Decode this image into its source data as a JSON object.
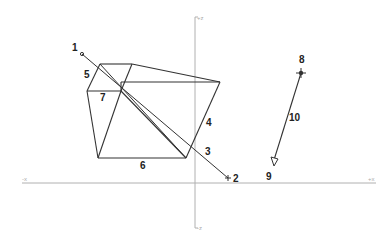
{
  "canvas": {
    "width": 391,
    "height": 244,
    "background": "#ffffff"
  },
  "axes": {
    "color": "#b0b0b0",
    "vertical": {
      "x": 195,
      "y1": 17,
      "y2": 228,
      "top_label": "+z",
      "bottom_label": "-z"
    },
    "horizontal": {
      "y": 183,
      "x1": 22,
      "x2": 376,
      "left_label": "-x",
      "right_label": "+x"
    }
  },
  "labels": [
    {
      "id": "1",
      "text": "1",
      "x": 72,
      "y": 51
    },
    {
      "id": "2",
      "text": "2",
      "x": 233,
      "y": 182
    },
    {
      "id": "3",
      "text": "3",
      "x": 205,
      "y": 155
    },
    {
      "id": "4",
      "text": "4",
      "x": 206,
      "y": 126
    },
    {
      "id": "5",
      "text": "5",
      "x": 84,
      "y": 78
    },
    {
      "id": "6",
      "text": "6",
      "x": 140,
      "y": 169
    },
    {
      "id": "7",
      "text": "7",
      "x": 100,
      "y": 101
    },
    {
      "id": "8",
      "text": "8",
      "x": 299,
      "y": 63
    },
    {
      "id": "9",
      "text": "9",
      "x": 266,
      "y": 180
    },
    {
      "id": "10",
      "text": "10",
      "x": 289,
      "y": 121
    }
  ],
  "shapes": {
    "line_color": "#333333",
    "polyhedron_edges": [
      [
        100,
        64,
        132,
        64
      ],
      [
        132,
        64,
        220,
        82
      ],
      [
        100,
        64,
        87,
        91
      ],
      [
        87,
        91,
        121,
        91
      ],
      [
        121,
        91,
        132,
        64
      ],
      [
        121,
        91,
        121,
        82
      ],
      [
        121,
        82,
        220,
        82
      ],
      [
        87,
        91,
        98,
        158
      ],
      [
        98,
        158,
        186,
        158
      ],
      [
        186,
        158,
        220,
        82
      ],
      [
        98,
        158,
        121,
        91
      ],
      [
        121,
        91,
        186,
        158
      ]
    ],
    "diagonal_line": {
      "x1": 82,
      "y1": 54,
      "x2": 228,
      "y2": 178
    },
    "point1": {
      "x": 82,
      "y": 54
    },
    "point2_cross": {
      "x": 228,
      "y": 178
    },
    "vector": {
      "x1": 301,
      "y1": 73,
      "x2": 274,
      "y2": 166
    }
  }
}
